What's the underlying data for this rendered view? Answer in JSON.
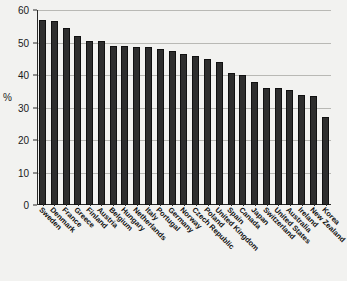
{
  "chart_data": {
    "type": "bar",
    "title": "",
    "xlabel": "",
    "ylabel": "%",
    "ylim": [
      0,
      60
    ],
    "yticks": [
      0,
      10,
      20,
      30,
      40,
      50,
      60
    ],
    "grid": true,
    "legend": "none",
    "orientation": "vertical",
    "bar_color": "#2e2e2e",
    "categories": [
      "Sweden",
      "Denmark",
      "France",
      "Greece",
      "Finland",
      "Austria",
      "Belgium",
      "Hungary",
      "Netherlands",
      "Italy",
      "Portugal",
      "Germany",
      "Norway",
      "Czech Republic",
      "Poland",
      "United Kingdom",
      "Spain",
      "Canada",
      "Japan",
      "Switzerland",
      "United States",
      "Australia",
      "Ireland",
      "New Zealand",
      "Korea"
    ],
    "values": [
      57,
      56.5,
      54.5,
      52,
      50.5,
      50.5,
      49,
      49,
      48.5,
      48.5,
      48,
      47.5,
      46.5,
      46,
      45,
      44,
      40.5,
      40,
      38,
      36,
      36,
      35.5,
      34,
      33.5,
      27
    ]
  },
  "axis": {
    "y_label_text": "%",
    "y_tick_labels": [
      "0",
      "10",
      "20",
      "30",
      "40",
      "50",
      "60"
    ]
  }
}
